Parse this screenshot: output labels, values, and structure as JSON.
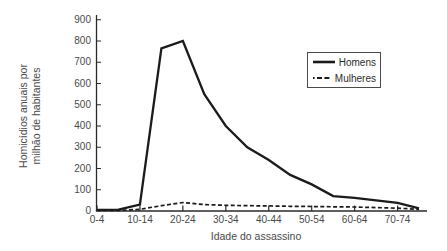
{
  "chart_data": {
    "type": "line",
    "title": "",
    "xlabel": "Idade do assassino",
    "ylabel": "Homicídios anuais por milhão de habitantes",
    "ylabel_lines": [
      "Homicídios anuais por",
      "milhão de habitantes"
    ],
    "categories": [
      "0-4",
      "5-9",
      "10-14",
      "15-19",
      "20-24",
      "25-29",
      "30-34",
      "35-39",
      "40-44",
      "45-49",
      "50-54",
      "55-59",
      "60-64",
      "65-69",
      "70-74",
      "75-79"
    ],
    "xtick_labels_visible": [
      "0-4",
      "10-14",
      "20-24",
      "30-34",
      "40-44",
      "50-54",
      "60-64",
      "70-74"
    ],
    "ytick_labels_top_to_bottom": [
      "900",
      "800",
      "700",
      "600",
      "500",
      "400",
      "300",
      "200",
      "100",
      "0"
    ],
    "ylim": [
      0,
      900
    ],
    "grid": "off",
    "legend_position": "upper right",
    "line_color": "#1b1b1b",
    "series": [
      {
        "name": "Homens",
        "style": "solid",
        "values": [
          5,
          6,
          30,
          765,
          800,
          550,
          400,
          300,
          240,
          170,
          125,
          70,
          62,
          50,
          38,
          12
        ]
      },
      {
        "name": "Mulheres",
        "style": "dash-dot",
        "values": [
          3,
          3,
          8,
          25,
          40,
          30,
          27,
          25,
          24,
          22,
          21,
          20,
          19,
          16,
          13,
          8
        ]
      }
    ]
  }
}
